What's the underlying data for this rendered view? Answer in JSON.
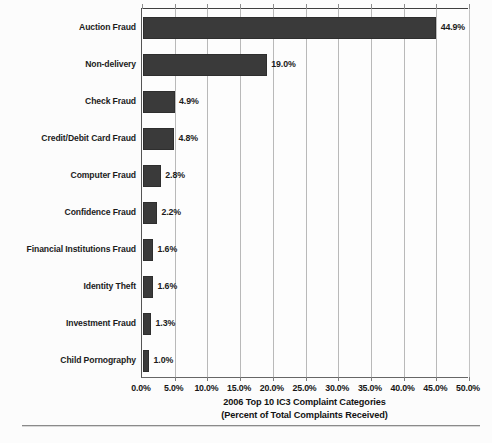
{
  "chart_data": {
    "type": "bar",
    "orientation": "horizontal",
    "title": "2006 Top 10 IC3 Complaint Categories",
    "subtitle": "(Percent of Total Complaints Received)",
    "xlabel": "",
    "ylabel": "",
    "xlim": [
      0,
      50
    ],
    "grid": true,
    "legend": false,
    "categories": [
      "Auction Fraud",
      "Non-delivery",
      "Check Fraud",
      "Credit/Debit Card Fraud",
      "Computer Fraud",
      "Confidence Fraud",
      "Financial Institutions Fraud",
      "Identity Theft",
      "Investment Fraud",
      "Child Pornography"
    ],
    "values": [
      44.9,
      19.0,
      4.9,
      4.8,
      2.8,
      2.2,
      1.6,
      1.6,
      1.3,
      1.0
    ],
    "data_labels": [
      "44.9%",
      "19.0%",
      "4.9%",
      "4.8%",
      "2.8%",
      "2.2%",
      "1.6%",
      "1.6%",
      "1.3%",
      "1.0%"
    ],
    "xticks": [
      0,
      5,
      10,
      15,
      20,
      25,
      30,
      35,
      40,
      45,
      50
    ],
    "xtick_labels": [
      "0.0%",
      "5.0%",
      "10.0%",
      "15.0%",
      "20.0%",
      "25.0%",
      "30.0%",
      "35.0%",
      "40.0%",
      "45.0%",
      "50.0%"
    ],
    "bar_color": "#3a3a3a",
    "gridline_color": "#b9b9b9",
    "background_color": "#fdfdfd"
  }
}
